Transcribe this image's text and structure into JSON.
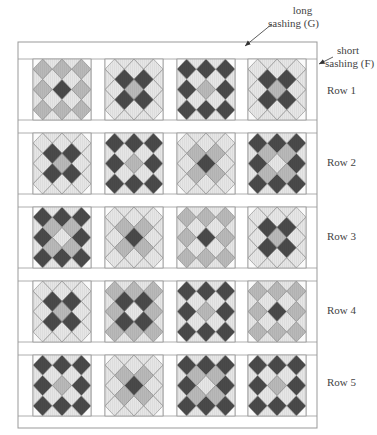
{
  "annotations": {
    "long_sashing_line1": "long",
    "long_sashing_line2": "sashing (G)",
    "short_sashing_line1": "short",
    "short_sashing_line2": "sashing (F)"
  },
  "row_labels": [
    "Row 1",
    "Row 2",
    "Row 3",
    "Row 4",
    "Row 5"
  ],
  "colors": {
    "dark": "#4a4a4a",
    "medium": "#b9b9b9",
    "light": "#e6e6e6",
    "line": "#888888",
    "frame": "#999999",
    "background": "#ffffff"
  },
  "layout": {
    "frame": {
      "x": 18,
      "y": 42,
      "w": 299,
      "h": 386
    },
    "block_x": [
      33,
      105,
      177,
      248
    ],
    "block_y": [
      59,
      133,
      207,
      281,
      355
    ],
    "block_w": 58,
    "block_h": 61
  },
  "blocks": [
    [
      {
        "grid": "M",
        "center": "D",
        "inner": "L"
      },
      {
        "grid": "L",
        "center": "M",
        "inner": "D"
      },
      {
        "grid": "D",
        "center": "M",
        "inner": "L"
      },
      {
        "grid": "L",
        "center": "M",
        "inner": "D"
      }
    ],
    [
      {
        "grid": "L",
        "center": "M",
        "inner": "D"
      },
      {
        "grid": "D",
        "center": "M",
        "inner": "L"
      },
      {
        "grid": "L",
        "center": "D",
        "inner": "M"
      },
      {
        "grid": "D",
        "center": "L",
        "inner": "M"
      }
    ],
    [
      {
        "grid": "D",
        "center": "L",
        "inner": "M"
      },
      {
        "grid": "L",
        "center": "D",
        "inner": "M"
      },
      {
        "grid": "M",
        "center": "D",
        "inner": "L"
      },
      {
        "grid": "L",
        "center": "M",
        "inner": "D"
      }
    ],
    [
      {
        "grid": "L",
        "center": "M",
        "inner": "D"
      },
      {
        "grid": "M",
        "center": "L",
        "inner": "D"
      },
      {
        "grid": "D",
        "center": "M",
        "inner": "L"
      },
      {
        "grid": "M",
        "center": "D",
        "inner": "L"
      }
    ],
    [
      {
        "grid": "D",
        "center": "M",
        "inner": "L"
      },
      {
        "grid": "L",
        "center": "D",
        "inner": "M"
      },
      {
        "grid": "D",
        "center": "L",
        "inner": "M"
      },
      {
        "grid": "D",
        "center": "M",
        "inner": "L"
      }
    ]
  ]
}
